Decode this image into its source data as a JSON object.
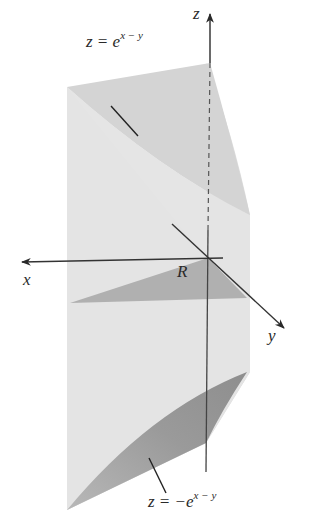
{
  "figure": {
    "colors": {
      "background": "#ffffff",
      "side_walls": "#e2e2e2",
      "top_surface": "#d9d9d9",
      "region_R": "#b3b3b3",
      "bottom_surface": "#9c9c9c",
      "axis": "#3a3a3a"
    }
  },
  "labels": {
    "top_surface": {
      "base": "z = e",
      "exp": "x − y"
    },
    "bottom_surface": {
      "base": "z = −e",
      "exp": "x − y"
    },
    "region": "R",
    "axis_x": "x",
    "axis_y": "y",
    "axis_z": "z"
  }
}
